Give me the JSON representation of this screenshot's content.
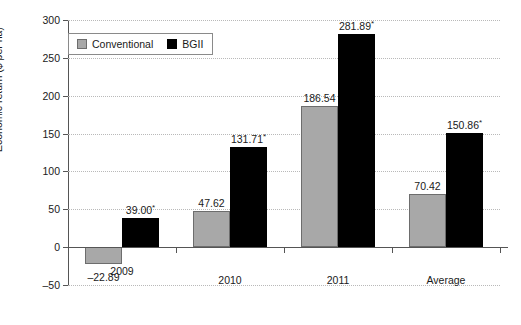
{
  "chart_data": {
    "type": "bar",
    "title": "",
    "xlabel": "",
    "ylabel": "Economic return ($ per ha)",
    "categories": [
      "2009",
      "2010",
      "2011",
      "Average"
    ],
    "series": [
      {
        "name": "Conventional",
        "color": "#a8a8a8",
        "values": [
          -22.89,
          47.62,
          186.54,
          70.42
        ],
        "labels": [
          "–22.89",
          "47.62",
          "186.54",
          "70.42"
        ]
      },
      {
        "name": "BGII",
        "color": "#000000",
        "values": [
          39.0,
          131.71,
          281.89,
          150.86
        ],
        "labels": [
          "39.00*",
          "131.71*",
          "281.89*",
          "150.86*"
        ]
      }
    ],
    "ylim": [
      -50,
      300
    ],
    "yticks": [
      -50,
      0,
      50,
      100,
      150,
      200,
      250,
      300
    ],
    "ytick_labels": [
      "–50",
      "0",
      "50",
      "100",
      "150",
      "200",
      "250",
      "300"
    ],
    "grid": true,
    "legend_position": "top-left",
    "significance_marker": "*"
  },
  "legend": {
    "items": [
      {
        "label": "Conventional"
      },
      {
        "label": "BGII"
      }
    ]
  }
}
